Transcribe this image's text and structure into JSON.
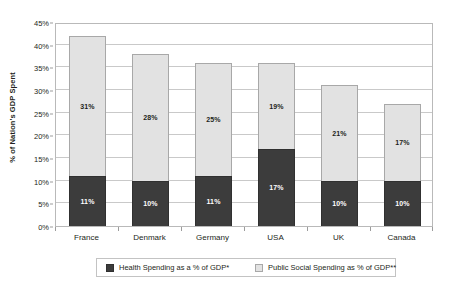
{
  "chart_data": {
    "type": "bar",
    "subtype": "stacked-bar",
    "title": "",
    "xlabel": "",
    "ylabel": "% of Nation's GDP Spent",
    "ylim": [
      0,
      45
    ],
    "ytick_step": 5,
    "ytick_labels": [
      "0%",
      "5%",
      "10%",
      "15%",
      "20%",
      "25%",
      "30%",
      "35%",
      "40%",
      "45%"
    ],
    "ytick_values": [
      0,
      5,
      10,
      15,
      20,
      25,
      30,
      35,
      40,
      45
    ],
    "grid": true,
    "grid_axis": "y",
    "legend_position": "bottom",
    "categories": [
      "France",
      "Denmark",
      "Germany",
      "USA",
      "UK",
      "Canada"
    ],
    "series": [
      {
        "name": "Health Spending as a % of GDP*",
        "color": "#3c3c3c",
        "values": [
          11,
          10,
          11,
          17,
          10,
          10
        ],
        "labels": [
          "11%",
          "10%",
          "11%",
          "17%",
          "10%",
          "10%"
        ]
      },
      {
        "name": "Public Social Spending as % of GDP**",
        "color": "#e2e2e2",
        "values": [
          31,
          28,
          25,
          19,
          21,
          17
        ],
        "labels": [
          "31%",
          "28%",
          "25%",
          "19%",
          "21%",
          "17%"
        ]
      }
    ],
    "totals": [
      43,
      38,
      36,
      36,
      31,
      27
    ]
  },
  "axis": {
    "y_title": "% of Nation's GDP Spent"
  },
  "legend": {
    "items": [
      {
        "label": "Health Spending as a % of GDP*",
        "color": "#3c3c3c"
      },
      {
        "label": "Public Social Spending as % of GDP**",
        "color": "#e2e2e2"
      }
    ]
  },
  "colors": {
    "health": "#3c3c3c",
    "public_social": "#e2e2e2",
    "grid": "#c9c9c9",
    "frame": "#b9b9b9",
    "text": "#231f20",
    "background": "#ffffff"
  }
}
